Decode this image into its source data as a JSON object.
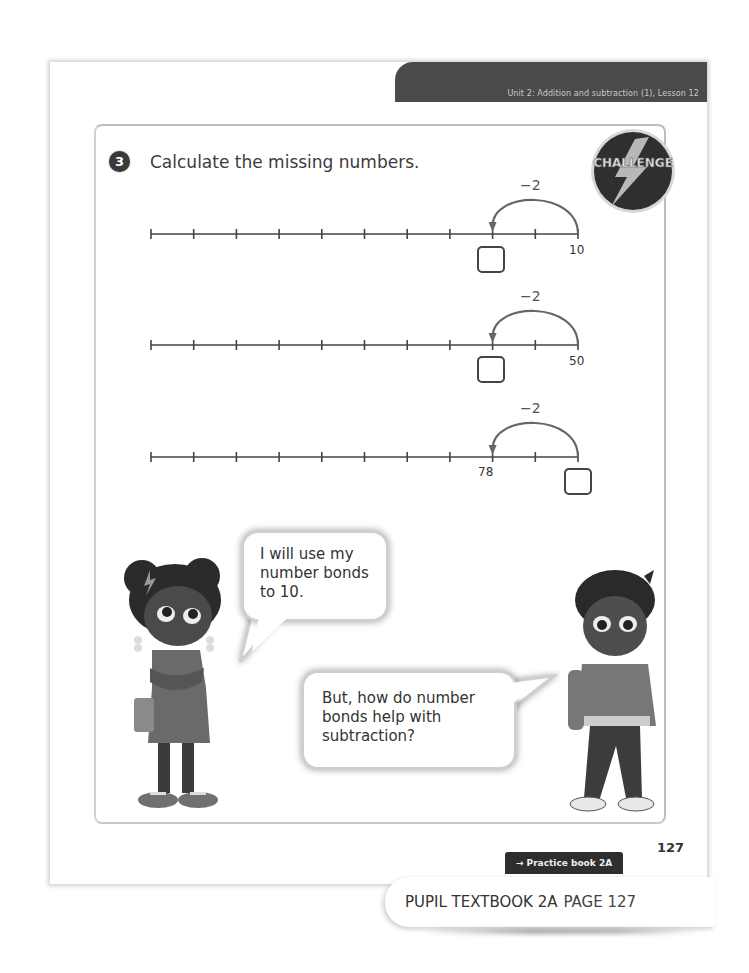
{
  "header": {
    "unit_lesson": "Unit 2: Addition and subtraction (1), Lesson 12"
  },
  "question": {
    "number": "3",
    "prompt": "Calculate the missing numbers.",
    "badge": "CHALLENGE"
  },
  "number_lines": [
    {
      "jump_label": "−2",
      "known_value": "10",
      "known_position": "end",
      "answer_position": "start_of_jump",
      "answer": ""
    },
    {
      "jump_label": "−2",
      "known_value": "50",
      "known_position": "end",
      "answer_position": "start_of_jump",
      "answer": ""
    },
    {
      "jump_label": "−2",
      "known_value": "78",
      "known_position": "start_of_jump",
      "answer_position": "end",
      "answer": ""
    }
  ],
  "number_line_layout": {
    "tick_count": 11,
    "x_start": 151,
    "x_end": 578,
    "y_positions": [
      234,
      345,
      457
    ]
  },
  "speech": {
    "girl": "I will use my number bonds to 10.",
    "boy": "But, how do number bonds help with subtraction?"
  },
  "footer": {
    "page_number": "127",
    "practice_ref": "→ Practice book 2A p92",
    "book_title": "PUPIL TEXTBOOK 2A",
    "book_page": "PAGE 127"
  },
  "colors": {
    "banner": "#4a4a4a",
    "panel_border": "#bdbdbd",
    "arc": "#666666",
    "practice_tag": "#2e2e2e"
  }
}
